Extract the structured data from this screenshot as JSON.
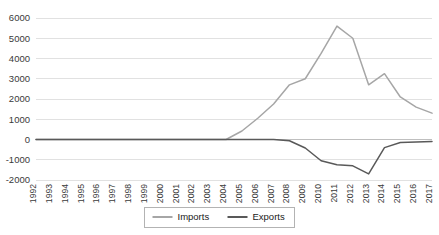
{
  "chart_data": {
    "type": "line",
    "title": "",
    "subtitle": "",
    "xlabel": "",
    "ylabel": "",
    "grid": true,
    "legend_position": "bottom-center",
    "ylim": [
      -2000,
      6000
    ],
    "ytick_labels": [
      "6000",
      "5000",
      "4000",
      "3000",
      "2000",
      "1000",
      "0",
      "-1000",
      "-2000"
    ],
    "ytick_values": [
      6000,
      5000,
      4000,
      3000,
      2000,
      1000,
      0,
      -1000,
      -2000
    ],
    "categories": [
      "1992",
      "1993",
      "1994",
      "1995",
      "1996",
      "1997",
      "1998",
      "1999",
      "2000",
      "2001",
      "2002",
      "2003",
      "2004",
      "2005",
      "2006",
      "2007",
      "2008",
      "2009",
      "2010",
      "2011",
      "2012",
      "2013",
      "2014",
      "2015",
      "2016",
      "2017"
    ],
    "series": [
      {
        "name": "Imports",
        "color": "#a6a6a6",
        "values": [
          0,
          0,
          0,
          0,
          0,
          0,
          0,
          0,
          0,
          0,
          0,
          0,
          0,
          420,
          1050,
          1750,
          2700,
          3000,
          4250,
          5600,
          5000,
          2700,
          3250,
          2100,
          1600,
          1300
        ]
      },
      {
        "name": "Exports",
        "color": "#595959",
        "values": [
          0,
          0,
          0,
          0,
          0,
          0,
          0,
          0,
          0,
          0,
          0,
          0,
          0,
          0,
          0,
          0,
          -60,
          -420,
          -1050,
          -1250,
          -1300,
          -1700,
          -400,
          -150,
          -120,
          -100
        ]
      }
    ]
  },
  "legend": {
    "entries": [
      {
        "label": "Imports",
        "color": "#a6a6a6"
      },
      {
        "label": "Exports",
        "color": "#595959"
      }
    ]
  }
}
